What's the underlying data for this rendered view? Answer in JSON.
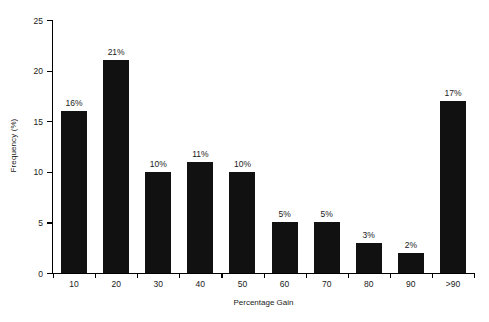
{
  "chart_data": {
    "type": "bar",
    "title": "",
    "subtitle": "",
    "xlabel": "Percentage Gain",
    "ylabel": "Frequency (%)",
    "categories": [
      "10",
      "20",
      "30",
      "40",
      "50",
      "60",
      "70",
      "80",
      "90",
      ">90"
    ],
    "values": [
      16,
      21,
      10,
      11,
      10,
      5,
      5,
      3,
      2,
      17
    ],
    "data_labels": [
      "16%",
      "21%",
      "10%",
      "11%",
      "10%",
      "5%",
      "5%",
      "3%",
      "2%",
      "17%"
    ],
    "ylim": [
      0,
      25
    ],
    "yticks": [
      0,
      5,
      10,
      15,
      20,
      25
    ],
    "ytick_labels": [
      "0",
      "5",
      "10",
      "15",
      "20",
      "25"
    ],
    "grid": false,
    "legend": null,
    "bar_color": "#111111",
    "background_color": "#ffffff",
    "axis_color": "#000000"
  }
}
